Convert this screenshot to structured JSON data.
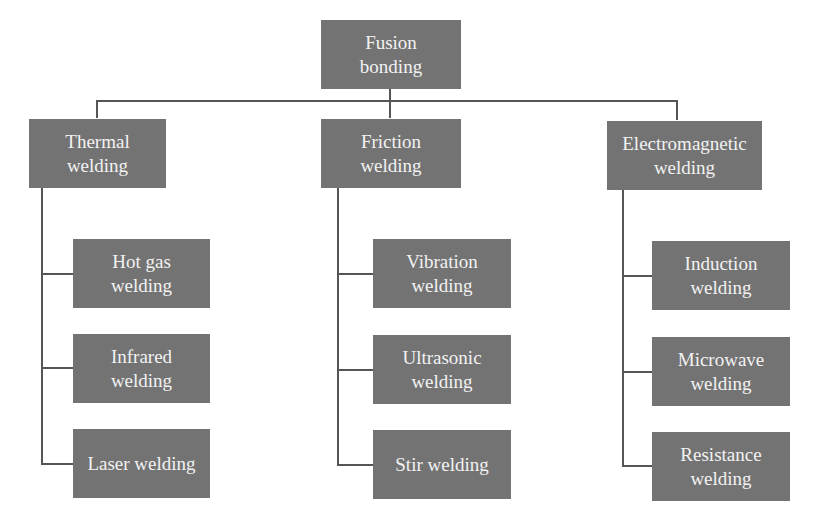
{
  "root": {
    "label_line1": "Fusion",
    "label_line2": "bonding"
  },
  "categories": [
    {
      "label_line1": "Thermal",
      "label_line2": "welding",
      "children": [
        {
          "label_line1": "Hot gas",
          "label_line2": "welding"
        },
        {
          "label_line1": "Infrared",
          "label_line2": "welding"
        },
        {
          "label_line1": "Laser welding",
          "label_line2": ""
        }
      ]
    },
    {
      "label_line1": "Friction",
      "label_line2": "welding",
      "children": [
        {
          "label_line1": "Vibration",
          "label_line2": "welding"
        },
        {
          "label_line1": "Ultrasonic",
          "label_line2": "welding"
        },
        {
          "label_line1": "Stir welding",
          "label_line2": ""
        }
      ]
    },
    {
      "label_line1": "Electromagnetic",
      "label_line2": "welding",
      "children": [
        {
          "label_line1": "Induction",
          "label_line2": "welding"
        },
        {
          "label_line1": "Microwave",
          "label_line2": "welding"
        },
        {
          "label_line1": "Resistance",
          "label_line2": "welding"
        }
      ]
    }
  ],
  "colors": {
    "box_fill": "#737373",
    "box_text": "#f2f2f2",
    "connector": "#555555"
  }
}
